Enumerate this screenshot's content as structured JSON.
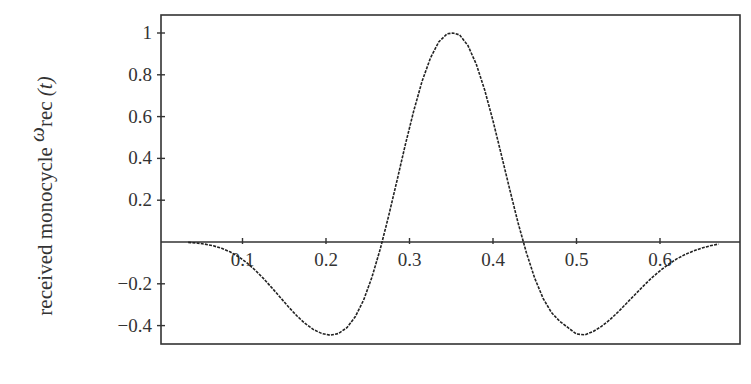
{
  "chart_data": {
    "type": "line",
    "title": "",
    "xlabel": "",
    "ylabel": "received monocycle ω_rec (t)",
    "ylabel_parts": {
      "prefix": "received monocycle ",
      "symbol": "ω",
      "subscript": "rec",
      "suffix": " (t)"
    },
    "xlim": [
      0,
      0.695
    ],
    "ylim": [
      -0.49,
      1.09
    ],
    "x_ticks": [
      0.1,
      0.2,
      0.3,
      0.4,
      0.5,
      0.6
    ],
    "x_tick_labels": [
      "0.1",
      "0.2",
      "0.3",
      "0.4",
      "0.5",
      "0.6"
    ],
    "y_ticks": [
      1,
      0.8,
      0.6,
      0.4,
      0.2,
      -0.2,
      -0.4
    ],
    "y_tick_labels": [
      "1",
      "0.8",
      "0.6",
      "0.4",
      "0.2",
      "−0.2",
      "−0.4"
    ],
    "x_axis_at_y": 0,
    "grid": false,
    "legend": null,
    "series": [
      {
        "name": "received monocycle",
        "color": "#222222",
        "x": [
          0.035,
          0.045,
          0.055,
          0.065,
          0.075,
          0.085,
          0.095,
          0.105,
          0.115,
          0.125,
          0.135,
          0.145,
          0.155,
          0.165,
          0.175,
          0.185,
          0.195,
          0.205,
          0.215,
          0.225,
          0.235,
          0.245,
          0.255,
          0.265,
          0.275,
          0.285,
          0.295,
          0.305,
          0.315,
          0.325,
          0.335,
          0.345,
          0.352,
          0.36,
          0.37,
          0.38,
          0.39,
          0.4,
          0.41,
          0.42,
          0.43,
          0.44,
          0.45,
          0.46,
          0.47,
          0.48,
          0.49,
          0.5,
          0.51,
          0.52,
          0.53,
          0.54,
          0.55,
          0.56,
          0.57,
          0.58,
          0.59,
          0.6,
          0.61,
          0.62,
          0.63,
          0.64,
          0.65,
          0.66,
          0.67
        ],
        "y": [
          -0.002,
          -0.005,
          -0.01,
          -0.018,
          -0.03,
          -0.047,
          -0.07,
          -0.099,
          -0.134,
          -0.174,
          -0.218,
          -0.264,
          -0.31,
          -0.353,
          -0.39,
          -0.419,
          -0.438,
          -0.446,
          -0.438,
          -0.41,
          -0.358,
          -0.278,
          -0.169,
          -0.033,
          0.124,
          0.294,
          0.465,
          0.627,
          0.768,
          0.88,
          0.957,
          0.996,
          1.0,
          0.991,
          0.94,
          0.85,
          0.727,
          0.58,
          0.418,
          0.252,
          0.093,
          -0.051,
          -0.174,
          -0.27,
          -0.338,
          -0.38,
          -0.41,
          -0.44,
          -0.444,
          -0.428,
          -0.404,
          -0.372,
          -0.334,
          -0.293,
          -0.252,
          -0.211,
          -0.172,
          -0.138,
          -0.107,
          -0.081,
          -0.06,
          -0.043,
          -0.029,
          -0.018,
          -0.01
        ]
      }
    ]
  },
  "plot_frame": {
    "left": 161,
    "right": 740,
    "top": 15,
    "bottom": 344
  },
  "mapping": {
    "x0_px": 159,
    "px_per_unit_x": 835,
    "y0_px": 242,
    "px_per_unit_y": 209
  }
}
